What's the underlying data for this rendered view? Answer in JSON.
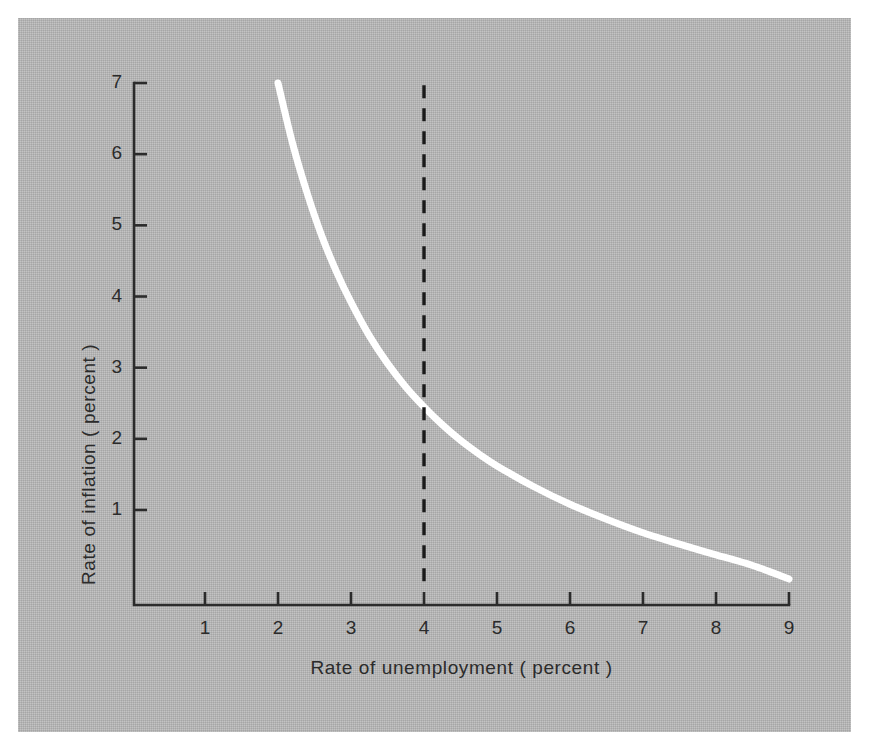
{
  "figure": {
    "background_color": "#ffffff",
    "panel_color": "#b4b4b4",
    "axis_color": "#2b2b2b",
    "curve_color": "#ffffff",
    "dashed_line_color": "#1a1a1a"
  },
  "chart_data": {
    "type": "line",
    "title": "",
    "subtitle": "",
    "xlabel": "Rate of unemployment ( percent )",
    "ylabel": "Rate of inflation ( percent )",
    "xlim": [
      0,
      9.3
    ],
    "ylim": [
      0,
      7.3
    ],
    "xticks": [
      1,
      2,
      3,
      4,
      5,
      6,
      7,
      8,
      9
    ],
    "xtick_labels": [
      "1",
      "2",
      "3",
      "4",
      "5",
      "6",
      "7",
      "8",
      "9"
    ],
    "yticks": [
      1,
      2,
      3,
      4,
      5,
      6,
      7
    ],
    "ytick_labels": [
      "1",
      "2",
      "3",
      "4",
      "5",
      "6",
      "7"
    ],
    "grid": false,
    "legend": null,
    "legend_position": "none",
    "series": [
      {
        "name": "Phillips curve",
        "color": "#ffffff",
        "linewidth": 7,
        "style": "solid",
        "x": [
          2.0,
          2.2,
          2.4,
          2.6,
          2.8,
          3.0,
          3.25,
          3.5,
          3.75,
          4.0,
          4.25,
          4.5,
          4.75,
          5.0,
          5.5,
          6.0,
          6.5,
          7.0,
          7.5,
          8.0,
          8.5,
          9.0
        ],
        "y": [
          7.0,
          6.15,
          5.45,
          4.85,
          4.35,
          3.92,
          3.45,
          3.06,
          2.73,
          2.45,
          2.2,
          1.98,
          1.79,
          1.62,
          1.33,
          1.08,
          0.87,
          0.68,
          0.52,
          0.37,
          0.22,
          0.03
        ]
      }
    ],
    "annotations": [
      {
        "type": "vertical-dashed-line",
        "name": "natural-rate-line",
        "x": 4.0,
        "y_from": 0.0,
        "y_to": 7.05,
        "color": "#1a1a1a",
        "dash": "dashed",
        "label": ""
      }
    ]
  }
}
